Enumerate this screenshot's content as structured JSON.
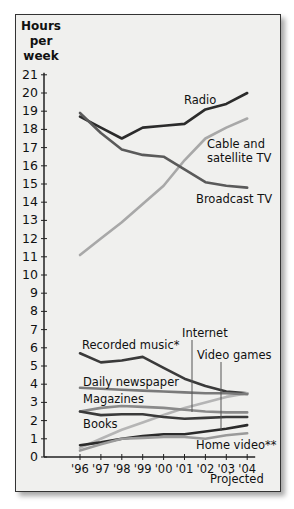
{
  "chart_data": {
    "type": "line",
    "title": "",
    "ylabel": "Hours per week",
    "xlabel": "Projected",
    "x": [
      "'96",
      "'97",
      "'98",
      "'99",
      "'00",
      "'01",
      "'02",
      "'03",
      "'04"
    ],
    "yticks": [
      0,
      1,
      2,
      3,
      4,
      5,
      6,
      7,
      8,
      9,
      10,
      11,
      12,
      13,
      14,
      15,
      16,
      17,
      18,
      19,
      20,
      21
    ],
    "ylim": [
      0,
      21
    ],
    "grid": false,
    "legend": "inline labels",
    "series": [
      {
        "name": "Radio",
        "color": "#2b2b2b",
        "values": [
          18.7,
          18.1,
          17.5,
          18.1,
          18.2,
          18.3,
          19.1,
          19.4,
          20.0
        ]
      },
      {
        "name": "Cable and satellite TV",
        "color": "#a8a8a8",
        "values": [
          11.1,
          12.0,
          12.9,
          13.9,
          14.9,
          16.3,
          17.5,
          18.1,
          18.6
        ]
      },
      {
        "name": "Broadcast TV",
        "color": "#5a5a5a",
        "values": [
          18.9,
          17.8,
          16.9,
          16.6,
          16.5,
          15.8,
          15.1,
          14.9,
          14.8
        ]
      },
      {
        "name": "Recorded music*",
        "color": "#3a3a3a",
        "values": [
          5.7,
          5.2,
          5.3,
          5.5,
          4.9,
          4.3,
          3.9,
          3.6,
          3.5
        ]
      },
      {
        "name": "Internet",
        "color": "#b5b5b5",
        "values": [
          0.5,
          1.0,
          1.5,
          1.9,
          2.3,
          2.7,
          3.0,
          3.3,
          3.5
        ]
      },
      {
        "name": "Daily newspaper",
        "color": "#7a7a7a",
        "values": [
          3.8,
          3.75,
          3.7,
          3.65,
          3.6,
          3.55,
          3.5,
          3.5,
          3.45
        ]
      },
      {
        "name": "Magazines",
        "color": "#8a8a8a",
        "values": [
          2.5,
          2.7,
          2.8,
          2.75,
          2.7,
          2.6,
          2.5,
          2.45,
          2.45
        ]
      },
      {
        "name": "Books",
        "color": "#3a3a3a",
        "values": [
          2.5,
          2.3,
          2.35,
          2.35,
          2.2,
          2.1,
          2.15,
          2.2,
          2.2
        ]
      },
      {
        "name": "Video games",
        "color": "#2b2b2b",
        "values": [
          0.65,
          0.8,
          1.0,
          1.15,
          1.25,
          1.25,
          1.4,
          1.55,
          1.75
        ]
      },
      {
        "name": "Home video**",
        "color": "#9a9a9a",
        "values": [
          0.35,
          0.7,
          1.0,
          1.05,
          1.1,
          1.1,
          1.0,
          1.2,
          1.3
        ]
      }
    ]
  },
  "labels": {
    "yaxis_line1": "Hours",
    "yaxis_line2": "per",
    "yaxis_line3": "week",
    "projected": "Projected",
    "radio": "Radio",
    "cable_1": "Cable and",
    "cable_2": "satellite TV",
    "broadcast": "Broadcast TV",
    "music": "Recorded music*",
    "internet": "Internet",
    "video_games": "Video games",
    "newspaper": "Daily newspaper",
    "magazines": "Magazines",
    "books": "Books",
    "home_video": "Home video**"
  }
}
